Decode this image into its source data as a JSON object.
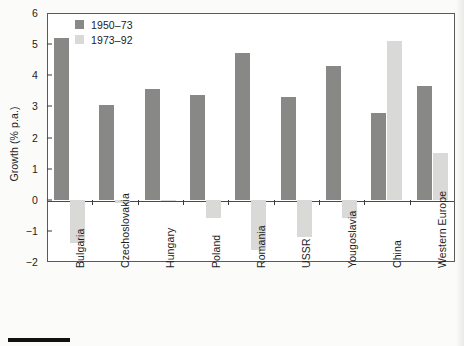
{
  "chart_data": {
    "type": "bar",
    "title": "",
    "xlabel": "",
    "ylabel": "Growth (% p.a.)",
    "ylim": [
      -2,
      6
    ],
    "yticks": [
      6,
      5,
      4,
      3,
      2,
      1,
      0,
      -1,
      -2
    ],
    "ytick_labels": [
      "6",
      "5",
      "4",
      "3",
      "2",
      "1",
      "0",
      "−1",
      "−2"
    ],
    "grid": false,
    "legend_position": "upper-left-inside",
    "categories": [
      "Bulgaria",
      "Czechoslovakia",
      "Hungary",
      "Poland",
      "Romania",
      "USSR",
      "Yougoslavia",
      "China",
      "Western Europe"
    ],
    "series": [
      {
        "name": "1950–73",
        "color": "#888886",
        "values": [
          5.2,
          3.05,
          3.55,
          3.35,
          4.7,
          3.3,
          4.3,
          2.8,
          3.65
        ]
      },
      {
        "name": "1973–92",
        "color": "#d9d9d7",
        "values": [
          -1.4,
          -0.1,
          -0.02,
          -0.6,
          -1.6,
          -1.2,
          -0.6,
          5.1,
          1.5
        ]
      }
    ]
  },
  "legend": {
    "items": [
      {
        "label": "1950–73",
        "color": "#888886"
      },
      {
        "label": "1973–92",
        "color": "#d9d9d7"
      }
    ]
  },
  "colors": {
    "series_dark": "#888886",
    "series_light": "#d9d9d7",
    "axis": "#5a5a5a",
    "text": "#1c1c1c",
    "background": "#ffffff"
  }
}
